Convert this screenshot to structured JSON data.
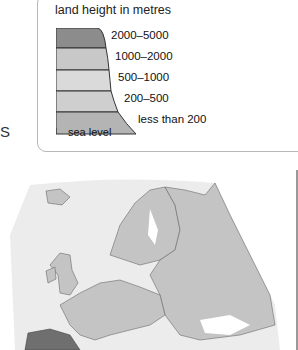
{
  "side_text": "S",
  "legend": {
    "title": "land height in metres",
    "bands": [
      {
        "label": "2000–5000",
        "color": "#8c8c8c"
      },
      {
        "label": "1000–2000",
        "color": "#c8c8c8"
      },
      {
        "label": "500–1000",
        "color": "#dadada"
      },
      {
        "label": "200–500",
        "color": "#cfcfcf"
      },
      {
        "label": "less than 200",
        "color": "#b4b4b4"
      }
    ],
    "baseline_label": "sea level"
  },
  "map": {
    "region": "Europe",
    "land_color": "#c4c4c4",
    "highland_color": "#6f6f6f",
    "border_color": "#6a6a6a",
    "sea_color": "#ffffff",
    "halo_color": "#ececec"
  }
}
